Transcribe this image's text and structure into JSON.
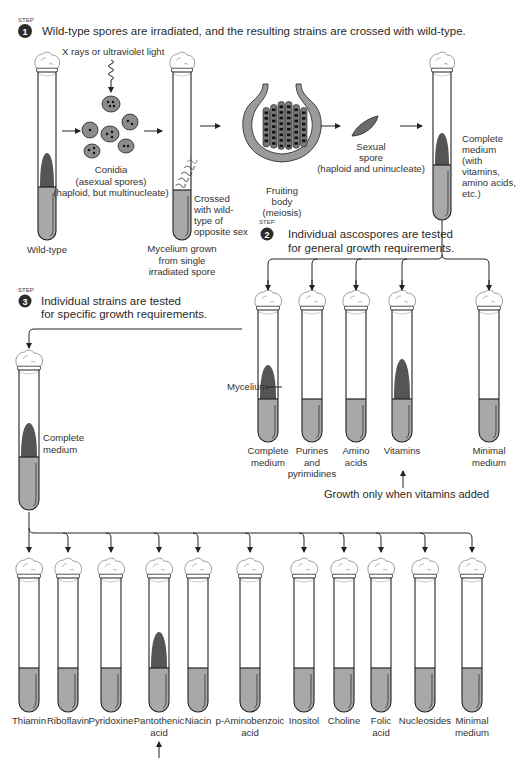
{
  "figure": {
    "colors": {
      "medium": "#a8a8a8",
      "growth": "#555555",
      "growth_light": "#8a8a8a",
      "outline": "#222222",
      "spore": "#8c8c8c",
      "fruiting_body_wall": "#9a9a9a",
      "badge": "#2b2b2b",
      "cotton": "#ffffff"
    }
  },
  "step1": {
    "badge": "1",
    "sup": "STEP",
    "text": "Wild-type spores are irradiated, and the resulting strains are crossed with wild-type.",
    "radiation_label": "X rays or ultraviolet light",
    "wildtype_label": "Wild-type",
    "conidia_label": [
      "Conidia",
      "(asexual spores)",
      "(haploid, but multinucleate)"
    ],
    "mycelium_label": [
      "Mycelium grown",
      "from single",
      "irradiated spore"
    ],
    "crossed_label": [
      "Crossed",
      "with wild-",
      "type of",
      "opposite sex"
    ],
    "fruiting_label": [
      "Fruiting",
      "body",
      "(meiosis)"
    ],
    "sexual_spore_label": [
      "Sexual",
      "spore",
      "(haploid and uninucleate)"
    ],
    "complete_medium_label": [
      "Complete",
      "medium",
      "(with",
      "vitamins,",
      "amino acids,",
      "etc.)"
    ]
  },
  "step2": {
    "badge": "2",
    "sup": "STEP",
    "text": [
      "Individual ascospores are tested",
      "for general growth requirements."
    ],
    "mycelium_pointer": "Mycelium",
    "tubes": [
      {
        "label": [
          "Complete",
          "medium"
        ],
        "growth": true
      },
      {
        "label": [
          "Purines",
          "and",
          "pyrimidines"
        ],
        "growth": false
      },
      {
        "label": [
          "Amino",
          "acids"
        ],
        "growth": false
      },
      {
        "label": [
          "Vitamins"
        ],
        "growth": true
      },
      {
        "label": [
          "Minimal",
          "medium"
        ],
        "growth": false
      }
    ],
    "result_note": "Growth only when vitamins added"
  },
  "step3": {
    "badge": "3",
    "sup": "STEP",
    "text": [
      "Individual strains are tested",
      "for specific growth requirements."
    ],
    "source_label": [
      "Complete",
      "medium"
    ],
    "tubes": [
      {
        "label": [
          "Thiamin"
        ],
        "growth": false
      },
      {
        "label": [
          "Riboflavin"
        ],
        "growth": false
      },
      {
        "label": [
          "Pyridoxine"
        ],
        "growth": false
      },
      {
        "label": [
          "Pantothenic",
          "acid"
        ],
        "growth": true
      },
      {
        "label": [
          "Niacin"
        ],
        "growth": false
      },
      {
        "label": [
          "p-Aminobenzoic",
          "acid"
        ],
        "growth": false
      },
      {
        "label": [
          "Inositol"
        ],
        "growth": false
      },
      {
        "label": [
          "Choline"
        ],
        "growth": false
      },
      {
        "label": [
          "Folic",
          "acid"
        ],
        "growth": false
      },
      {
        "label": [
          "Nucleosides"
        ],
        "growth": false
      },
      {
        "label": [
          "Minimal",
          "medium"
        ],
        "growth": false
      }
    ]
  }
}
